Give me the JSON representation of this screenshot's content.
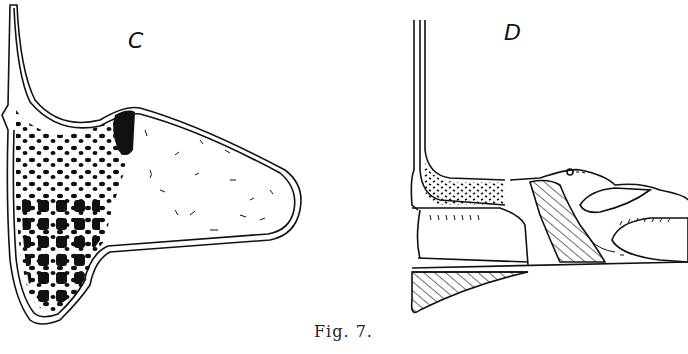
{
  "figure": {
    "panels": [
      {
        "label": "C"
      },
      {
        "label": "D"
      }
    ],
    "caption": "Fig. 7."
  },
  "colors": {
    "ink": "#111111",
    "paper": "#ffffff"
  }
}
